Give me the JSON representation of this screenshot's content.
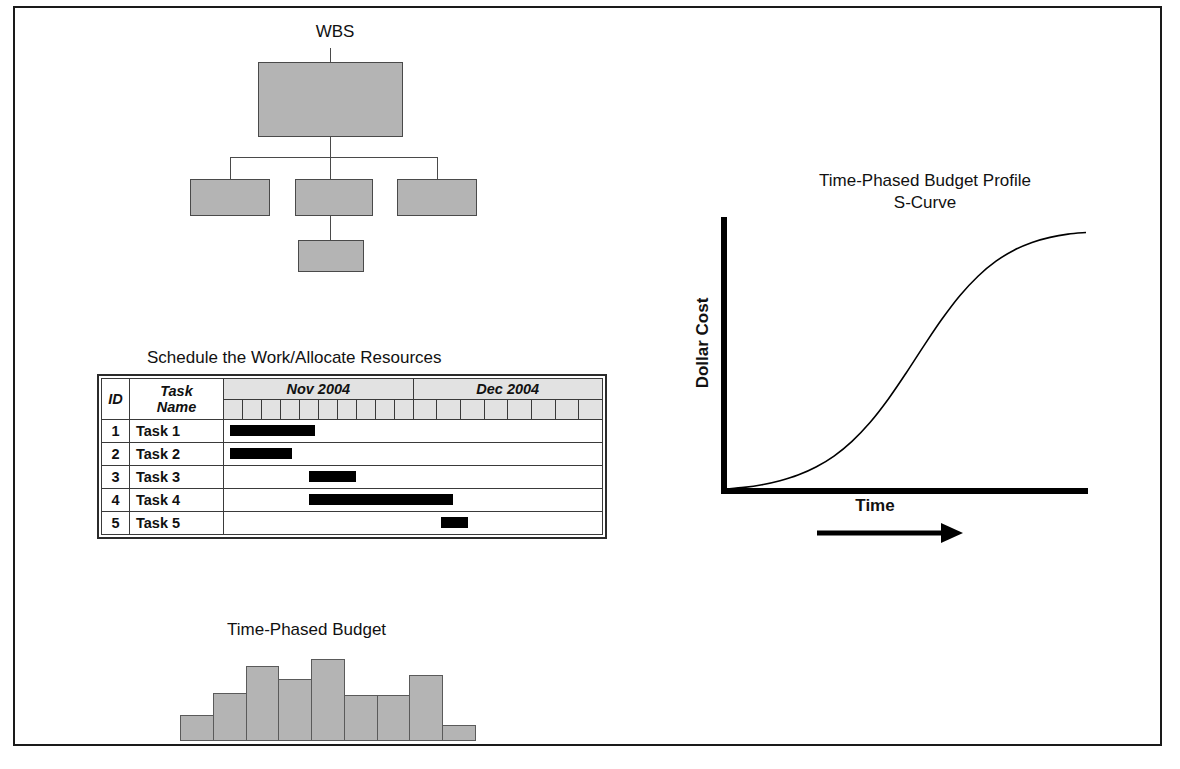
{
  "figure": {
    "background": "#ffffff",
    "border_color": "#1a1a1a"
  },
  "wbs": {
    "title": "WBS",
    "box_fill": "#b4b4b4",
    "box_stroke": "#4a4a4a",
    "nodes": [
      {
        "name": "root",
        "label": ""
      },
      {
        "name": "child-1",
        "label": ""
      },
      {
        "name": "child-2",
        "label": ""
      },
      {
        "name": "child-3",
        "label": ""
      },
      {
        "name": "grandchild",
        "label": ""
      }
    ]
  },
  "schedule": {
    "title": "Schedule the Work/Allocate Resources",
    "columns": {
      "id": "ID",
      "task_name": "Task\nName",
      "id_line1": "ID",
      "name_line1": "Task",
      "name_line2": "Name"
    },
    "months": [
      {
        "label": "Nov 2004",
        "days": 10
      },
      {
        "label": "Dec 2004",
        "days": 8
      }
    ],
    "rows": [
      {
        "id": "1",
        "name": "Task 1",
        "bar_start_pct": 1.5,
        "bar_width_pct": 22.5
      },
      {
        "id": "2",
        "name": "Task 2",
        "bar_start_pct": 1.5,
        "bar_width_pct": 16.5
      },
      {
        "id": "3",
        "name": "Task 3",
        "bar_start_pct": 22.5,
        "bar_width_pct": 12.5
      },
      {
        "id": "4",
        "name": "Task 4",
        "bar_start_pct": 22.5,
        "bar_width_pct": 38.0
      },
      {
        "id": "5",
        "name": "Task 5",
        "bar_start_pct": 57.5,
        "bar_width_pct": 7.0
      }
    ],
    "bar_color": "#000000",
    "header_fill": "#e2e2e2"
  },
  "budget": {
    "title": "Time-Phased Budget",
    "bar_fill": "#b4b4b4",
    "bar_stroke": "#5a5a5a",
    "chart_data": {
      "type": "bar",
      "title": "Time-Phased Budget",
      "xlabel": "",
      "ylabel": "",
      "categories": [
        "1",
        "2",
        "3",
        "4",
        "5",
        "6",
        "7",
        "8",
        "9"
      ],
      "values": [
        26,
        48,
        75,
        62,
        82,
        46,
        46,
        66,
        16
      ],
      "ylim": [
        0,
        88
      ],
      "grid": false,
      "legend": false
    }
  },
  "scurve": {
    "title_line1": "Time-Phased Budget Profile",
    "title_line2": "S-Curve",
    "ylabel": "Dollar Cost",
    "xlabel": "Time",
    "chart_data": {
      "type": "line",
      "title": "Time-Phased Budget Profile S-Curve",
      "xlabel": "Time",
      "ylabel": "Dollar Cost",
      "grid": false,
      "legend": false,
      "axis_color": "#000000",
      "line_color": "#000000",
      "x": [
        0,
        5,
        10,
        15,
        20,
        25,
        30,
        35,
        40,
        45,
        50,
        55,
        60,
        65,
        70,
        75,
        80,
        85,
        90,
        95,
        100
      ],
      "y": [
        0,
        0.6,
        1.6,
        3.1,
        5.2,
        8.2,
        12.3,
        17.8,
        24.8,
        33.4,
        43.2,
        53.5,
        63.4,
        72.2,
        79.4,
        85.0,
        89.1,
        92.0,
        93.9,
        95.1,
        95.7
      ],
      "xlim": [
        0,
        100
      ],
      "ylim": [
        0,
        100
      ]
    }
  }
}
